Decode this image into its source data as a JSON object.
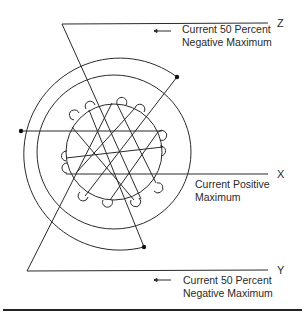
{
  "diagram": {
    "type": "three-phase stator winding diagram",
    "axes": [
      {
        "id": "Z",
        "label": "Z",
        "caption_line1": "Current 50 Percent",
        "caption_line2": "Negative Maximum",
        "arrow": "←"
      },
      {
        "id": "X",
        "label": "X",
        "caption_line1": "Current Positive",
        "caption_line2": "Maximum"
      },
      {
        "id": "Y",
        "label": "Y",
        "caption_line1": "Current 50 Percent",
        "caption_line2": "Negative Maximum",
        "arrow": "←"
      }
    ],
    "circles": {
      "count": 3,
      "inner_slots": 12
    },
    "terminal_dots": 3,
    "line_color": "#2a2a2a",
    "background": "#ffffff"
  }
}
